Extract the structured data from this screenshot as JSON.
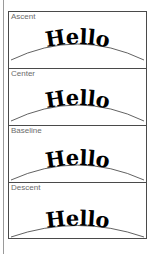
{
  "figure": {
    "sample_text": "Hello",
    "stroke_color": "#3a3a3a",
    "text_color": "#000000",
    "label_color": "#6b6b6b",
    "border_color": "#4a4a4a",
    "background_color": "#ffffff"
  },
  "panels": [
    {
      "label": "Ascent",
      "text": "Hello",
      "description": "Glyph ascent line aligned to the path; text hangs below the curve",
      "text_baseline_offset": 30
    },
    {
      "label": "Center",
      "text": "Hello",
      "description": "Glyph vertical center aligned to the path; curve crosses the middle of the letters",
      "text_baseline_offset": 22
    },
    {
      "label": "Baseline",
      "text": "Hello",
      "description": "Glyph baseline sits directly on the path",
      "text_baseline_offset": 13
    },
    {
      "label": "Descent",
      "text": "Hello",
      "description": "Glyph descent line aligned to the path; text rides above the curve",
      "text_baseline_offset": 5
    }
  ]
}
